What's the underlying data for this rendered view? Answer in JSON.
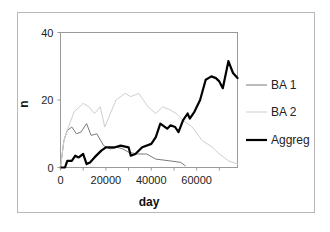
{
  "chart_data": {
    "type": "line",
    "title": "",
    "xlabel": "day",
    "ylabel": "n",
    "xlim": [
      0,
      78000
    ],
    "ylim": [
      0,
      40
    ],
    "xticks": [
      0,
      20000,
      40000,
      60000
    ],
    "yticks": [
      0,
      20,
      40
    ],
    "xtick_labels": [
      "0",
      "20000",
      "40000",
      "60000"
    ],
    "ytick_labels": [
      "0",
      "20",
      "40"
    ],
    "grid": false,
    "legend_position": "right",
    "series": [
      {
        "name": "BA 1",
        "color": "#7a7a7a",
        "width": 1,
        "x": [
          0,
          1500,
          3000,
          5000,
          7000,
          9000,
          11500,
          13500,
          16000,
          19000,
          22000,
          25000,
          27500,
          30000,
          34000,
          38000,
          42000,
          48000,
          53000,
          55000
        ],
        "y": [
          0,
          8,
          11,
          12,
          10,
          10.5,
          13,
          9.5,
          10,
          6.5,
          5.5,
          6,
          5.5,
          4.5,
          4,
          4,
          2.5,
          2,
          1.5,
          0.5
        ]
      },
      {
        "name": "BA 2",
        "color": "#cfcfcf",
        "width": 1,
        "x": [
          0,
          1500,
          3000,
          6000,
          10000,
          12500,
          15000,
          17500,
          19500,
          22000,
          24500,
          28500,
          31000,
          34500,
          38500,
          42000,
          45000,
          48500,
          51000,
          54000,
          58000,
          62500,
          67000,
          70000,
          74000,
          78000
        ],
        "y": [
          0,
          8,
          11,
          16.5,
          19,
          18,
          16,
          18,
          12,
          16,
          20,
          22,
          21,
          22,
          18,
          16,
          18,
          17,
          16,
          14,
          12,
          8,
          6,
          4,
          2,
          1
        ]
      },
      {
        "name": "Aggreg",
        "color": "#000000",
        "width": 2.2,
        "x": [
          0,
          2000,
          3000,
          5000,
          6500,
          8000,
          10000,
          11500,
          13000,
          15000,
          18000,
          20000,
          24000,
          26500,
          30000,
          31000,
          33000,
          36000,
          40000,
          42000,
          44000,
          47000,
          48500,
          50500,
          52000,
          54000,
          56000,
          57000,
          59000,
          61500,
          64000,
          66500,
          68500,
          70000,
          71500,
          74000,
          76000,
          78000
        ],
        "y": [
          0,
          0,
          2,
          2,
          3.5,
          3,
          4,
          1,
          1.5,
          3,
          5,
          6,
          6,
          6.5,
          6,
          3.5,
          4,
          6,
          7,
          9,
          13,
          11.5,
          12.5,
          12,
          10.5,
          14,
          16,
          14.5,
          16.5,
          20,
          26,
          27,
          26.5,
          25.5,
          23.5,
          31.5,
          28,
          26.5
        ]
      }
    ]
  }
}
